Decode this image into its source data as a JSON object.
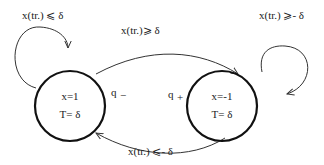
{
  "diagram": {
    "type": "state-machine",
    "states": [
      {
        "id": "s1",
        "line1": "x=1",
        "line2": "T= δ",
        "side_label": "q",
        "side_sub": "−"
      },
      {
        "id": "s2",
        "line1": "x=-1",
        "line2": "T= δ",
        "side_label": "q",
        "side_sub": "+"
      }
    ],
    "transitions": [
      {
        "from": "s1",
        "to": "s1",
        "label": "x(tr.) ⩽ δ"
      },
      {
        "from": "s1",
        "to": "s2",
        "label": "x(tr.)⩾ δ"
      },
      {
        "from": "s2",
        "to": "s2",
        "label": "x(tr.) ⩾- δ"
      },
      {
        "from": "s2",
        "to": "s1",
        "label": "x(tr.) ⩽- δ"
      }
    ]
  }
}
